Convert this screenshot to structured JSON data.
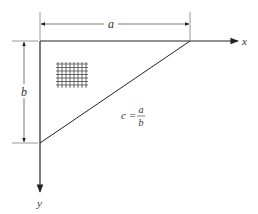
{
  "diagram": {
    "labels": {
      "a": "a",
      "b": "b",
      "x_axis": "x",
      "y_axis": "y",
      "formula_lhs": "c =",
      "formula_num": "a",
      "formula_den": "b"
    },
    "colors": {
      "line": "#222222",
      "text": "#333333",
      "background": "#ffffff"
    }
  }
}
